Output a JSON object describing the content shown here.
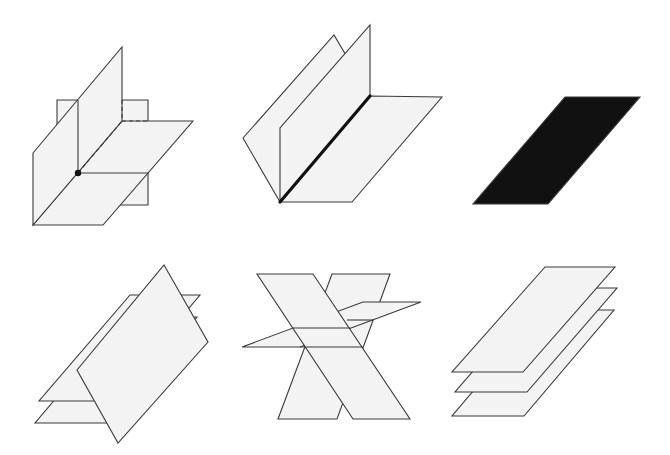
{
  "colors": {
    "plane_fill": "#f3f3f3",
    "line": "#3a3a3a",
    "solid_plane": "#111111",
    "background": "#ffffff"
  },
  "figures": [
    {
      "id": "three-perpendicular-planes-one-point",
      "description": "Three planes meeting in a single point",
      "planes": [
        {
          "name": "frontal-plane",
          "points": [
            [
              57,
              100
            ],
            [
              148,
              100
            ],
            [
              148,
              205
            ],
            [
              57,
              205
            ]
          ]
        },
        {
          "name": "horizontal-plane",
          "points": [
            [
              33,
              225
            ],
            [
              103,
              225
            ],
            [
              193,
              121
            ],
            [
              122,
              121
            ]
          ]
        },
        {
          "name": "side-plane",
          "points": [
            [
              33,
              153
            ],
            [
              122,
              47
            ],
            [
              122,
              121
            ],
            [
              33,
              225
            ]
          ]
        }
      ],
      "lines": [
        {
          "from": [
            78,
            100
          ],
          "to": [
            78,
            173
          ],
          "style": "solid"
        },
        {
          "from": [
            78,
            173
          ],
          "to": [
            148,
            173
          ],
          "style": "solid"
        },
        {
          "from": [
            78,
            173
          ],
          "to": [
            122,
            121
          ],
          "style": "dashed"
        },
        {
          "from": [
            122,
            100
          ],
          "to": [
            122,
            121
          ],
          "style": "dashed"
        },
        {
          "from": [
            122,
            121
          ],
          "to": [
            148,
            121
          ],
          "style": "dashed"
        }
      ],
      "point": {
        "x": 78,
        "y": 173,
        "r": 3.2
      }
    },
    {
      "id": "three-planes-common-line",
      "description": "Three planes sharing a common line",
      "planes": [
        {
          "name": "back-slanted-plane",
          "points": [
            [
              280,
              202
            ],
            [
              243,
              138
            ],
            [
              334,
              35
            ],
            [
              370,
              96
            ]
          ]
        },
        {
          "name": "horizontal-plane",
          "points": [
            [
              280,
              202
            ],
            [
              352,
              202
            ],
            [
              442,
              97
            ],
            [
              370,
              96
            ]
          ]
        },
        {
          "name": "vertical-plane",
          "points": [
            [
              280,
              202
            ],
            [
              280,
              128
            ],
            [
              370,
              25
            ],
            [
              370,
              96
            ]
          ]
        }
      ],
      "lines": [],
      "thick_line": {
        "from": [
          280,
          202
        ],
        "to": [
          370,
          96
        ]
      }
    },
    {
      "id": "coincident-planes",
      "description": "Coincident planes shown as a solid plane",
      "planes": [
        {
          "name": "solid-plane",
          "points": [
            [
              565,
              97
            ],
            [
              640,
              97
            ],
            [
              548,
              204
            ],
            [
              473,
              204
            ]
          ]
        }
      ]
    },
    {
      "id": "three-planes-parallel-lines",
      "description": "Three planes intersecting in parallel lines",
      "planes": [
        {
          "name": "lower-plane",
          "points": [
            [
              125,
              317
            ],
            [
              197,
              317
            ],
            [
              107,
              423
            ],
            [
              35,
              423
            ]
          ]
        },
        {
          "name": "upper-plane",
          "points": [
            [
              130,
              295
            ],
            [
              200,
              295
            ],
            [
              110,
              401
            ],
            [
              39,
              401
            ]
          ]
        },
        {
          "name": "vertical-plane",
          "points": [
            [
              164,
              265
            ],
            [
              208,
              342
            ],
            [
              118,
              443
            ],
            [
              77,
              370
            ]
          ]
        }
      ],
      "lines": []
    },
    {
      "id": "two-planes-cut-by-third",
      "description": "Two crossing planes cut by a third plane",
      "planes": [
        {
          "name": "right-leaning-plane",
          "points": [
            [
              332,
              274
            ],
            [
              390,
              274
            ],
            [
              337,
              419
            ],
            [
              278,
              419
            ]
          ]
        },
        {
          "name": "slanted-thin-plane",
          "points": [
            [
              242,
              347
            ],
            [
              300,
              347
            ],
            [
              421,
              302
            ],
            [
              363,
              302
            ]
          ]
        },
        {
          "name": "left-leaning-plane",
          "points": [
            [
              257,
              274
            ],
            [
              313,
              274
            ],
            [
              410,
              419
            ],
            [
              353,
              419
            ]
          ]
        }
      ],
      "lines": [
        {
          "from": [
            300,
            347
          ],
          "to": [
            363,
            347
          ],
          "style": "solid"
        },
        {
          "from": [
            293,
            328
          ],
          "to": [
            350,
            328
          ],
          "style": "solid"
        },
        {
          "from": [
            347,
            320
          ],
          "to": [
            373,
            320
          ],
          "style": "solid"
        }
      ]
    },
    {
      "id": "three-parallel-planes",
      "description": "Three parallel planes",
      "planes": [
        {
          "name": "bottom-plane",
          "points": [
            [
              542,
              310
            ],
            [
              614,
              310
            ],
            [
              524,
              416
            ],
            [
              452,
              416
            ]
          ]
        },
        {
          "name": "middle-plane",
          "points": [
            [
              545,
              288
            ],
            [
              617,
              288
            ],
            [
              527,
              392
            ],
            [
              455,
              392
            ]
          ]
        },
        {
          "name": "top-plane",
          "points": [
            [
              545,
              267
            ],
            [
              615,
              267
            ],
            [
              523,
              372
            ],
            [
              452,
              372
            ]
          ]
        }
      ],
      "lines": []
    }
  ]
}
